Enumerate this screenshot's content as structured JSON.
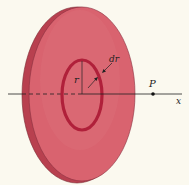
{
  "figure": {
    "labels": {
      "radius": "r",
      "ring_width": "dr",
      "point": "P",
      "axis": "x"
    },
    "colors": {
      "background": "#fbf9ef",
      "disc_face": "#d9636f",
      "disc_edge": "#b8404f",
      "disc_outline": "#7a2a33",
      "ring": "#b0203a",
      "axis_line": "#222222"
    }
  }
}
